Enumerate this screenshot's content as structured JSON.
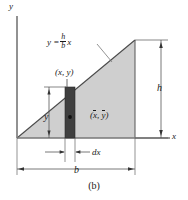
{
  "figure": {
    "caption": "(b)",
    "axes": {
      "y_label": "y",
      "x_label": "x"
    },
    "labels": {
      "equation_lhs": "y =",
      "equation_num": "h",
      "equation_den": "b",
      "equation_var": "x",
      "point_xy": "(x, y)",
      "centroid_open": "(",
      "centroid_x": "x",
      "centroid_comma": ", ",
      "centroid_y": "y",
      "centroid_close": ")",
      "height_h": "h",
      "base_b": "b",
      "strip_height_y": "y",
      "strip_width_dx": "dx"
    },
    "colors": {
      "triangle_fill": "#cfcfcf",
      "strip_fill": "#3f3f3f",
      "line": "#1a1a1a",
      "dimension_line": "#555555",
      "background": "#ffffff"
    },
    "geometry": {
      "origin_x": 17,
      "origin_y": 138,
      "apex_x": 135,
      "apex_y": 40,
      "strip_left": 65,
      "strip_right": 75,
      "strip_top": 87
    }
  }
}
